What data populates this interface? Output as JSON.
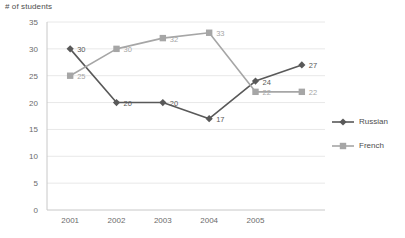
{
  "chart_data": {
    "type": "line",
    "title": "",
    "ylabel": "# of students",
    "xlabel": "",
    "categories": [
      "2001",
      "2002",
      "2003",
      "2004",
      "2005",
      ""
    ],
    "x_tick_labels": [
      "2001",
      "2002",
      "2003",
      "2004",
      "2005"
    ],
    "y_tick_labels": [
      "0",
      "5",
      "10",
      "15",
      "20",
      "25",
      "30",
      "35"
    ],
    "ylim": [
      0,
      35
    ],
    "y_tick_step": 5,
    "grid": "horizontal",
    "legend_position": "right",
    "series": [
      {
        "name": "Russian",
        "color": "#595959",
        "marker": "diamond",
        "values": [
          30,
          20,
          20,
          17,
          24,
          27
        ],
        "labels": [
          "30",
          "20",
          "20",
          "17",
          "24",
          "27"
        ]
      },
      {
        "name": "French",
        "color": "#a6a6a6",
        "marker": "square",
        "values": [
          25,
          30,
          32,
          33,
          22,
          22
        ],
        "labels": [
          "25",
          "30",
          "32",
          "33",
          "22",
          "22"
        ]
      }
    ]
  },
  "legend": {
    "items": [
      {
        "label": "Russian"
      },
      {
        "label": "French"
      }
    ]
  },
  "colors": {
    "series_russian": "#595959",
    "series_french": "#a6a6a6",
    "gridline": "#e8e8e8",
    "axis": "#c8c8c8",
    "text": "#5a5a5a"
  }
}
